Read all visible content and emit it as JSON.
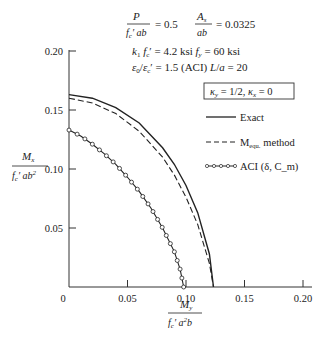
{
  "chart_data": {
    "type": "line",
    "title_lines": [
      {
        "frac1_num": "P",
        "frac1_den": "f_c' ab",
        "eq1": "= 0.5",
        "frac2_num": "A_s",
        "frac2_den": "ab",
        "eq2": "= 0.0325"
      },
      {
        "text": "k_1 f_c' = 4.2 ksi    f_y = 60 ksi"
      },
      {
        "text": "ε_0/ε_c' = 1.5 (ACI)   L/a = 20"
      }
    ],
    "annotation_box": "κ_y = 1/2,  κ_x = 0",
    "xlabel": {
      "num": "M_y",
      "den": "f_c' a²b"
    },
    "ylabel": {
      "num": "M_x",
      "den": "f_c' ab²"
    },
    "xlim": [
      0,
      0.2
    ],
    "ylim": [
      0,
      0.2
    ],
    "x_ticks": [
      "0",
      "0.05",
      "0.10",
      "0.15",
      "0.20"
    ],
    "y_ticks": [
      "0.05",
      "0.10",
      "0.15",
      "0.20"
    ],
    "grid": false,
    "legend_position": "right",
    "series": [
      {
        "name": "Exact",
        "style": "solid",
        "x": [
          0,
          0.02,
          0.04,
          0.06,
          0.08,
          0.09,
          0.1,
          0.11,
          0.12,
          0.1235
        ],
        "y": [
          0.163,
          0.16,
          0.152,
          0.139,
          0.118,
          0.104,
          0.086,
          0.063,
          0.028,
          0
        ]
      },
      {
        "name": "M equ. method",
        "style": "dashed",
        "x": [
          0,
          0.02,
          0.04,
          0.06,
          0.08,
          0.09,
          0.1,
          0.11,
          0.12,
          0.1235
        ],
        "y": [
          0.16,
          0.156,
          0.147,
          0.132,
          0.11,
          0.095,
          0.076,
          0.053,
          0.02,
          0
        ]
      },
      {
        "name": "ACI (δ, C_m)",
        "style": "solid-circles",
        "x": [
          0,
          0.01,
          0.02,
          0.03,
          0.04,
          0.05,
          0.06,
          0.07,
          0.08,
          0.09,
          0.095,
          0.098
        ],
        "y": [
          0.133,
          0.128,
          0.121,
          0.113,
          0.104,
          0.093,
          0.081,
          0.067,
          0.05,
          0.03,
          0.015,
          0
        ]
      }
    ]
  },
  "legend": {
    "exact": "Exact",
    "mequ_prefix": "M",
    "mequ_sub": "equ.",
    "mequ_suffix": "method",
    "aci": "ACI (δ, C_m)"
  }
}
